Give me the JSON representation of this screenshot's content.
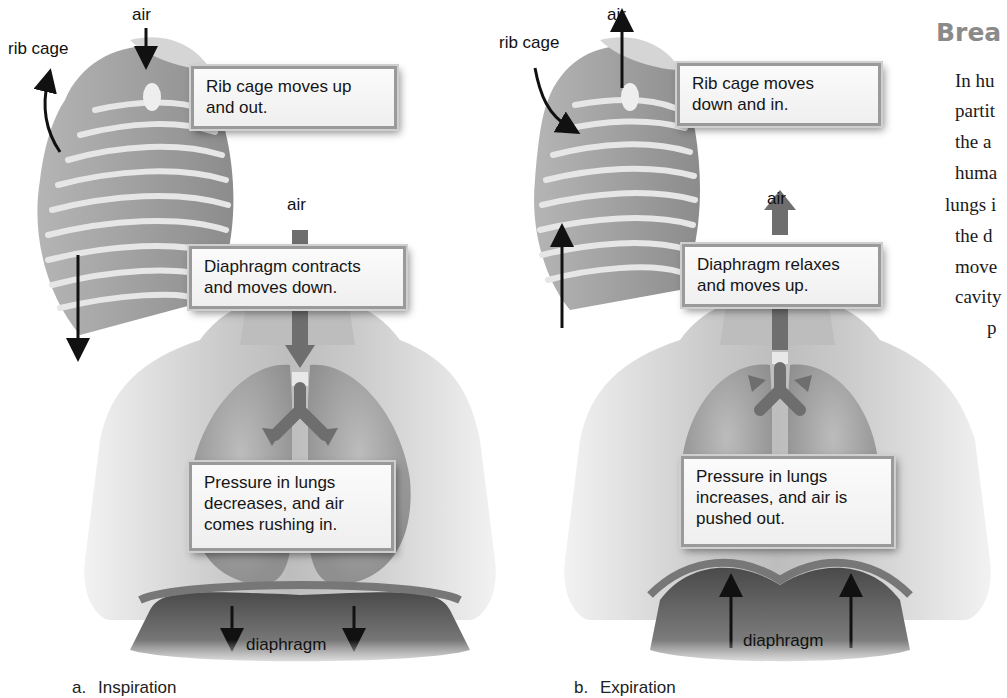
{
  "panel_a": {
    "caption_letter": "a.",
    "caption": "Inspiration",
    "labels": {
      "rib_cage": "rib cage",
      "air_top": "air",
      "air_mid": "air",
      "diaphragm": "diaphragm"
    },
    "callouts": {
      "rib_cage": "Rib cage moves up\nand out.",
      "diaphragm": "Diaphragm contracts\nand moves down.",
      "pressure": "Pressure in lungs\ndecreases, and air\ncomes rushing in."
    },
    "arrow_directions": {
      "rib_cage": "up-and-out",
      "air": "in (downward)",
      "diaphragm": "down"
    }
  },
  "panel_b": {
    "caption_letter": "b.",
    "caption": "Expiration",
    "labels": {
      "rib_cage": "rib cage",
      "air_top": "air",
      "air_mid": "air",
      "diaphragm": "diaphragm"
    },
    "callouts": {
      "rib_cage": "Rib cage moves\ndown and in.",
      "diaphragm": "Diaphragm relaxes\nand moves up.",
      "pressure": "Pressure in lungs\nincreases, and air is\npushed out."
    },
    "arrow_directions": {
      "rib_cage": "down-and-in",
      "air": "out (upward)",
      "diaphragm": "up"
    }
  },
  "side_text": {
    "heading": "Brea",
    "lines": [
      "In hu",
      "partit",
      "the  a",
      "huma",
      "lungs i",
      "the  d",
      "move",
      "cavity",
      "p"
    ]
  },
  "colors": {
    "callout_border": "#9a9a9a",
    "callout_bg": "#f4f4f4",
    "heading_gray": "#8a8a8a",
    "arrow_black": "#111111",
    "airway_arrow_gray": "#6e6e6e"
  }
}
